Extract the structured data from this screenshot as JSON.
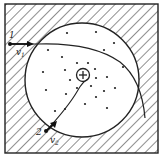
{
  "diagram": {
    "colors": {
      "ink": "#222222",
      "background": "#ffffff"
    },
    "nucleus": {
      "symbol": "+"
    },
    "particles": [
      {
        "id": 1,
        "label": "1",
        "velocity_label": "v",
        "velocity_subscript": "1"
      },
      {
        "id": 2,
        "label": "2",
        "velocity_label": "v",
        "velocity_subscript": "2"
      }
    ],
    "electron_count": 26
  }
}
